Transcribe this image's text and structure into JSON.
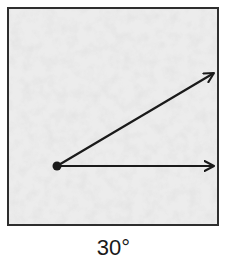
{
  "diagram": {
    "label": "30°",
    "angle_degrees": 30,
    "box": {
      "x": 8,
      "y": 8,
      "width": 210,
      "height": 217,
      "border_color": "#2e2e2e",
      "fill_color": "#ececec",
      "texture_vein_color": "#c6c6c6"
    },
    "vertex": {
      "x": 57,
      "y": 166,
      "radius": 4.5,
      "color": "#1a1a1a"
    },
    "rays": [
      {
        "name": "upper-ray",
        "x1": 57,
        "y1": 166,
        "x2": 216,
        "y2": 72
      },
      {
        "name": "base-ray",
        "x1": 57,
        "y1": 166,
        "x2": 216,
        "y2": 166
      }
    ],
    "ray_color": "#1a1a1a",
    "ray_width": 2.2
  }
}
